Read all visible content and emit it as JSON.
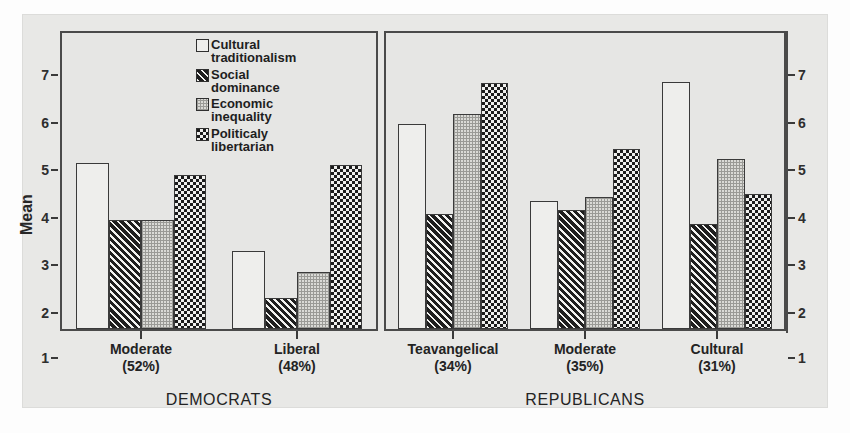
{
  "chart_data": {
    "type": "bar",
    "title": "",
    "xlabel": "",
    "ylabel": "Mean",
    "ylim": [
      1,
      7
    ],
    "yticks": [
      1,
      2,
      3,
      4,
      5,
      6,
      7
    ],
    "grid": false,
    "legend_position": "inside-top-center-left-panel",
    "panels": [
      {
        "name": "DEMOCRATS",
        "categories": [
          "Moderate\n(52%)",
          "Liberal\n(48%)"
        ],
        "category_labels": [
          {
            "name": "Moderate",
            "pct": "(52%)"
          },
          {
            "name": "Liberal",
            "pct": "(48%)"
          }
        ],
        "series": [
          {
            "name": "Cultural traditionalism",
            "values": [
              4.5,
              2.65
            ]
          },
          {
            "name": "Social dominance",
            "values": [
              3.3,
              1.65
            ]
          },
          {
            "name": "Economic inequality",
            "values": [
              3.3,
              2.2
            ]
          },
          {
            "name": "Politicaly libertarian",
            "values": [
              4.25,
              4.45
            ]
          }
        ]
      },
      {
        "name": "REPUBLICANS",
        "categories": [
          "Teavangelical\n(34%)",
          "Moderate\n(35%)",
          "Cultural\n(31%)"
        ],
        "category_labels": [
          {
            "name": "Teavangelical",
            "pct": "(34%)"
          },
          {
            "name": "Moderate",
            "pct": "(35%)"
          },
          {
            "name": "Cultural",
            "pct": "(31%)"
          }
        ],
        "series": [
          {
            "name": "Cultural traditionalism",
            "values": [
              5.32,
              3.7,
              6.2
            ]
          },
          {
            "name": "Social dominance",
            "values": [
              3.42,
              3.5,
              3.22
            ]
          },
          {
            "name": "Economic inequality",
            "values": [
              5.52,
              3.78,
              4.57
            ]
          },
          {
            "name": "Politicaly libertarian",
            "values": [
              6.18,
              4.78,
              3.85
            ]
          }
        ]
      }
    ],
    "legend": [
      {
        "label": "Cultural\ntraditionalism",
        "fill": "open",
        "color": "#eeeeec"
      },
      {
        "label": "Social\ndominance",
        "fill": "diagonal-hatch",
        "color": "#2c2c2c"
      },
      {
        "label": "Economic\ninequality",
        "fill": "fine-dots",
        "color": "#dadad6"
      },
      {
        "label": "Politicaly\nlibertarian",
        "fill": "checkerboard",
        "color": "#242424"
      }
    ]
  },
  "axis": {
    "ylabel": "Mean",
    "ticks": [
      "7",
      "6",
      "5",
      "4",
      "3",
      "2",
      "1"
    ]
  },
  "panels": {
    "democrats": {
      "title": "DEMOCRATS",
      "cats": [
        {
          "name": "Moderate",
          "pct": "(52%)"
        },
        {
          "name": "Liberal",
          "pct": "(48%)"
        }
      ]
    },
    "republicans": {
      "title": "REPUBLICANS",
      "cats": [
        {
          "name": "Teavangelical",
          "pct": "(34%)"
        },
        {
          "name": "Moderate",
          "pct": "(35%)"
        },
        {
          "name": "Cultural",
          "pct": "(31%)"
        }
      ]
    }
  },
  "legend": {
    "items": [
      {
        "label": "Cultural\ntraditionalism"
      },
      {
        "label": "Social\ndominance"
      },
      {
        "label": "Economic\ninequality"
      },
      {
        "label": "Politicaly\nlibertarian"
      }
    ]
  }
}
